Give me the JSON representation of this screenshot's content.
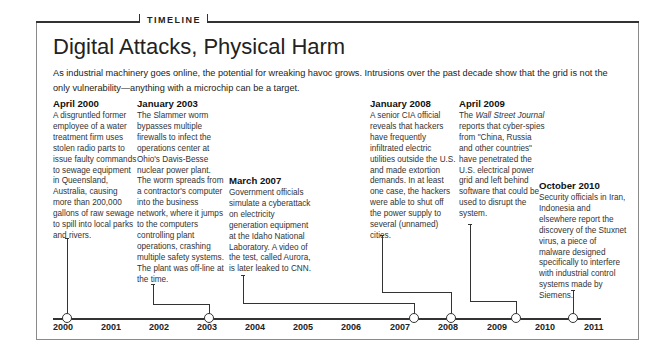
{
  "header": {
    "section_label": "TIMELINE",
    "title": "Digital Attacks, Physical Harm",
    "intro": "As industrial machinery goes online, the potential for wreaking havoc grows. Intrusions over the past decade show that the grid is not the only vulnerability—anything with a microchip can be a target."
  },
  "events": [
    {
      "date": "April 2000",
      "body": "A disgruntled former employee of a water treatment firm uses stolen radio parts to issue faulty commands to sewage equipment in Queensland, Australia, causing more than 200,000 gallons of raw sewage to spill into local parks and rivers."
    },
    {
      "date": "January 2003",
      "body": "The Slammer worm bypasses multiple firewalls to infect the operations center at Ohio's Davis-Besse nuclear power plant. The worm spreads from a contractor's computer into the business network, where it jumps to the computers controlling plant operations, crashing multiple safety systems. The plant was off-line at the time."
    },
    {
      "date": "March 2007",
      "body": "Government officials simulate a cyberattack on electricity generation equipment at the Idaho National Laboratory. A video of the test, called Aurora, is later leaked to CNN."
    },
    {
      "date": "January 2008",
      "body": "A senior CIA official reveals that hackers have frequently infiltrated electric utilities outside the U.S. and made extortion demands. In at least one case, the hackers were able to shut off the power supply to several (unnamed) cities."
    },
    {
      "date": "April 2009",
      "body_pre": "The ",
      "body_italic": "Wall Street Journal",
      "body_post": " reports that cyber-spies from \"China, Russia and other countries\" have penetrated the U.S. electrical power grid and left behind software that could be used to disrupt the system."
    },
    {
      "date": "October 2010",
      "body": "Security officials in Iran, Indonesia and elsewhere report the discovery of the Stuxnet virus, a piece of malware designed specifically to interfere with industrial control systems made by Siemens."
    }
  ],
  "axis": {
    "years": [
      "2000",
      "2001",
      "2002",
      "2003",
      "2004",
      "2005",
      "2006",
      "2007",
      "2008",
      "2009",
      "2010",
      "2011"
    ]
  },
  "colors": {
    "line": "#333333",
    "frame": "#8a8a8a",
    "text": "#222222"
  }
}
